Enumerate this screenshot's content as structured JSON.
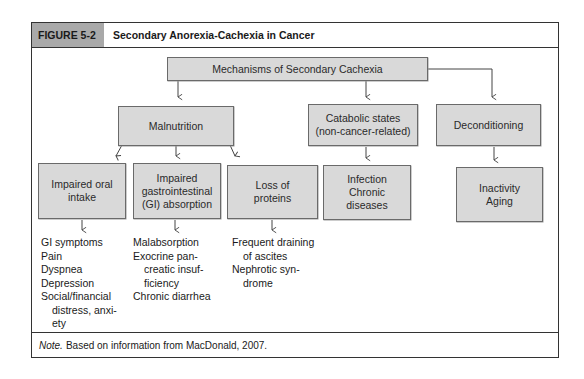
{
  "header": {
    "figure_label": "FIGURE 5-2",
    "title": "Secondary Anorexia-Cachexia in Cancer"
  },
  "diagram": {
    "root": "Mechanisms of Secondary Cachexia",
    "level1": {
      "malnutrition": "Malnutrition",
      "catabolic_line1": "Catabolic states",
      "catabolic_line2": "(non-cancer-related)",
      "deconditioning": "Deconditioning"
    },
    "level2": {
      "oral_line1": "Impaired oral",
      "oral_line2": "intake",
      "gi_line1": "Impaired",
      "gi_line2": "gastrointestinal",
      "gi_line3": "(GI) absorption",
      "proteins_line1": "Loss of",
      "proteins_line2": "proteins",
      "infection_line1": "Infection",
      "infection_line2": "Chronic",
      "infection_line3": "diseases",
      "inactivity_line1": "Inactivity",
      "inactivity_line2": "Aging"
    },
    "lists": {
      "oral": [
        "GI symptoms",
        "Pain",
        "Dyspnea",
        "Depression",
        "Social/financial",
        "distress, anxi-",
        "ety"
      ],
      "gi": [
        "Malabsorption",
        "Exocrine pan-",
        "creatic insuf-",
        "ficiency",
        "Chronic diarrhea"
      ],
      "proteins": [
        "Frequent draining",
        "of ascites",
        "Nephrotic syn-",
        "drome"
      ]
    }
  },
  "footer": {
    "note_label": "Note.",
    "note_text": "Based on information from MacDonald, 2007."
  },
  "colors": {
    "box_fill": "#d9d9d9",
    "header_label_fill": "#a9a9a9",
    "border": "#333333"
  }
}
